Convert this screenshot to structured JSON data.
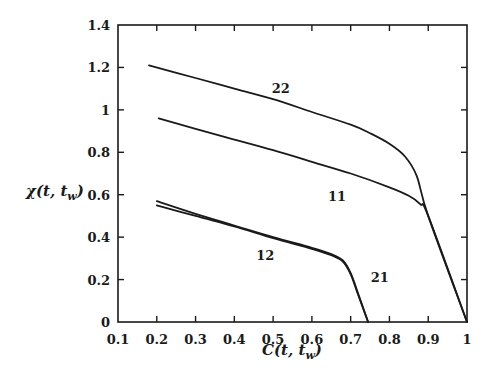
{
  "chart_data": {
    "type": "line",
    "title": "",
    "xlabel": "C(t, t_w)",
    "ylabel": "χ(t, t_w)",
    "xlim": [
      0.1,
      1.0
    ],
    "ylim": [
      0,
      1.4
    ],
    "grid": false,
    "legend": "none (curves labelled inline)",
    "x_ticks": [
      "0.1",
      "0.2",
      "0.3",
      "0.4",
      "0.5",
      "0.6",
      "0.7",
      "0.8",
      "0.9",
      "1"
    ],
    "y_ticks": [
      "0",
      "0.2",
      "0.4",
      "0.6",
      "0.8",
      "1",
      "1.2",
      "1.4"
    ],
    "series": [
      {
        "name": "22",
        "points": [
          [
            0.18,
            1.21
          ],
          [
            0.3,
            1.15
          ],
          [
            0.4,
            1.1
          ],
          [
            0.5,
            1.05
          ],
          [
            0.6,
            0.99
          ],
          [
            0.7,
            0.93
          ],
          [
            0.75,
            0.89
          ],
          [
            0.8,
            0.84
          ],
          [
            0.84,
            0.78
          ],
          [
            0.87,
            0.69
          ],
          [
            0.9,
            0.5
          ],
          [
            1.0,
            0.0
          ]
        ],
        "label_pos": [
          0.52,
          1.08
        ]
      },
      {
        "name": "11",
        "points": [
          [
            0.205,
            0.96
          ],
          [
            0.3,
            0.91
          ],
          [
            0.4,
            0.86
          ],
          [
            0.5,
            0.81
          ],
          [
            0.6,
            0.755
          ],
          [
            0.7,
            0.7
          ],
          [
            0.8,
            0.635
          ],
          [
            0.85,
            0.595
          ],
          [
            0.88,
            0.555
          ],
          [
            0.9,
            0.5
          ],
          [
            1.0,
            0.0
          ]
        ],
        "label_pos": [
          0.665,
          0.57
        ]
      },
      {
        "name": "12",
        "points": [
          [
            0.2,
            0.57
          ],
          [
            0.3,
            0.51
          ],
          [
            0.4,
            0.455
          ],
          [
            0.5,
            0.4
          ],
          [
            0.6,
            0.35
          ],
          [
            0.65,
            0.32
          ],
          [
            0.68,
            0.29
          ],
          [
            0.7,
            0.23
          ],
          [
            0.72,
            0.13
          ],
          [
            0.745,
            0.0
          ]
        ],
        "label_pos": [
          0.48,
          0.29
        ]
      },
      {
        "name": "21",
        "points": [
          [
            0.2,
            0.55
          ],
          [
            0.3,
            0.5
          ],
          [
            0.4,
            0.45
          ],
          [
            0.5,
            0.395
          ],
          [
            0.6,
            0.345
          ],
          [
            0.65,
            0.315
          ],
          [
            0.68,
            0.285
          ],
          [
            0.7,
            0.225
          ],
          [
            0.72,
            0.125
          ],
          [
            0.745,
            0.0
          ]
        ],
        "label_pos": [
          0.775,
          0.19
        ]
      }
    ]
  }
}
